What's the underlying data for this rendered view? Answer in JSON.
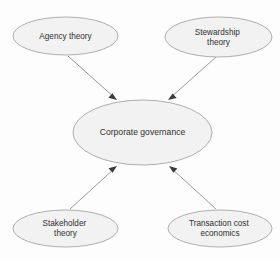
{
  "diagram": {
    "background_color": "#fdfdfd",
    "node_fill_color": "#f2f2f2",
    "node_stroke_color": "#9a9a9a",
    "edge_color": "#8d8d8d",
    "arrow_color": "#3a3a3a",
    "text_color": "#2f2f2f",
    "nodes": [
      {
        "id": "agency-theory",
        "label": "Agency theory",
        "lines": [
          "Agency theory"
        ],
        "cx": 65.5,
        "cy": 36,
        "rx": 52.5,
        "ry": 19
      },
      {
        "id": "stewardship-theory",
        "label": "Stewardship theory",
        "lines": [
          "Stewardship",
          "theory"
        ],
        "cx": 218.5,
        "cy": 37,
        "rx": 53.5,
        "ry": 20
      },
      {
        "id": "corporate-governance",
        "label": "Corporate governance",
        "lines": [
          "Corporate governance"
        ],
        "cx": 142.5,
        "cy": 132.5,
        "rx": 69.5,
        "ry": 32.5
      },
      {
        "id": "stakeholder-theory",
        "label": "Stakeholder theory",
        "lines": [
          "Stakeholder",
          "theory"
        ],
        "cx": 65.5,
        "cy": 228.5,
        "rx": 52.5,
        "ry": 18.5
      },
      {
        "id": "transaction-cost-economics",
        "label": "Transaction cost economics",
        "lines": [
          "Transaction cost",
          "economics"
        ],
        "cx": 220,
        "cy": 228.5,
        "rx": 52,
        "ry": 18.5
      }
    ],
    "edges": [
      {
        "id": "agency-to-governance",
        "from": "agency-theory",
        "to": "corporate-governance",
        "x1": 68,
        "y1": 56,
        "x2": 117,
        "y2": 100,
        "arrow": "end"
      },
      {
        "id": "stewardship-to-governance",
        "from": "stewardship-theory",
        "to": "corporate-governance",
        "x1": 216,
        "y1": 57,
        "x2": 168,
        "y2": 100,
        "arrow": "end"
      },
      {
        "id": "stakeholder-to-governance",
        "from": "stakeholder-theory",
        "to": "corporate-governance",
        "x1": 70,
        "y1": 209,
        "x2": 117,
        "y2": 166,
        "arrow": "end"
      },
      {
        "id": "transaction-to-governance",
        "from": "transaction-cost-economics",
        "to": "corporate-governance",
        "x1": 216,
        "y1": 209,
        "x2": 169,
        "y2": 166,
        "arrow": "end"
      }
    ]
  }
}
